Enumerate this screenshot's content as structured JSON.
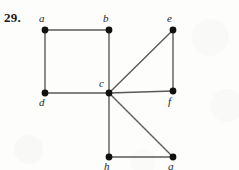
{
  "figure": {
    "problem_number": "29.",
    "background_color": "#fdfdfc",
    "edge_color": "#5a5a5a",
    "vertex_color": "#111111",
    "label_color": "#1d1d1d",
    "width": 239,
    "height": 170
  },
  "graph_data": {
    "type": "graph",
    "directed": false,
    "vertices": [
      {
        "id": "a",
        "label": "a",
        "x": 45,
        "y": 30,
        "label_x": 39,
        "label_y": 13
      },
      {
        "id": "b",
        "label": "b",
        "x": 109,
        "y": 30,
        "label_x": 103,
        "label_y": 13
      },
      {
        "id": "c",
        "label": "c",
        "x": 109,
        "y": 93,
        "label_x": 99,
        "label_y": 78
      },
      {
        "id": "d",
        "label": "d",
        "x": 45,
        "y": 93,
        "label_x": 39,
        "label_y": 97
      },
      {
        "id": "e",
        "label": "e",
        "x": 173,
        "y": 30,
        "label_x": 167,
        "label_y": 13
      },
      {
        "id": "f",
        "label": "f",
        "x": 173,
        "y": 91,
        "label_x": 168,
        "label_y": 96
      },
      {
        "id": "g",
        "label": "g",
        "x": 173,
        "y": 157,
        "label_x": 168,
        "label_y": 161
      },
      {
        "id": "h",
        "label": "h",
        "x": 109,
        "y": 157,
        "label_x": 104,
        "label_y": 161
      }
    ],
    "edges": [
      {
        "from": "a",
        "to": "b"
      },
      {
        "from": "a",
        "to": "d"
      },
      {
        "from": "b",
        "to": "c"
      },
      {
        "from": "d",
        "to": "c"
      },
      {
        "from": "c",
        "to": "e"
      },
      {
        "from": "c",
        "to": "f"
      },
      {
        "from": "c",
        "to": "g"
      },
      {
        "from": "c",
        "to": "h"
      },
      {
        "from": "e",
        "to": "f"
      },
      {
        "from": "h",
        "to": "g"
      }
    ],
    "vertex_radius": 3.4,
    "edge_width": 1.4,
    "degree_sequence": {
      "a": 2,
      "b": 2,
      "c": 5,
      "d": 2,
      "e": 2,
      "f": 2,
      "g": 2,
      "h": 2
    }
  }
}
